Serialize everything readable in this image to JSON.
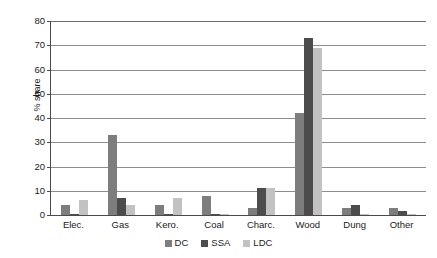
{
  "chart_data": {
    "type": "bar",
    "title": "",
    "xlabel": "",
    "ylabel": "% share",
    "ylim": [
      0,
      80
    ],
    "ytick_step": 10,
    "yticks": [
      0,
      10,
      20,
      30,
      40,
      50,
      60,
      70,
      80
    ],
    "ytick_labels": [
      "0",
      "10",
      "20",
      "30",
      "40",
      "50",
      "60",
      "70",
      "80"
    ],
    "grid": "horizontal",
    "legend_position": "bottom-center",
    "categories": [
      "Elec.",
      "Gas",
      "Kero.",
      "Coal",
      "Charc.",
      "Wood",
      "Dung",
      "Other"
    ],
    "series": [
      {
        "name": "DC",
        "color": "#7d7d7d",
        "values": [
          4,
          33,
          4,
          8,
          3,
          42,
          3,
          3
        ]
      },
      {
        "name": "SSA",
        "color": "#4c4c4c",
        "values": [
          0.5,
          7,
          0.5,
          0.5,
          11,
          73,
          4,
          1.5
        ]
      },
      {
        "name": "LDC",
        "color": "#c2c2c2",
        "values": [
          6,
          4,
          7,
          0.5,
          11,
          69,
          0.3,
          0.3
        ]
      }
    ]
  },
  "axes": {
    "y_title": "% share"
  },
  "legend": {
    "entries": [
      {
        "label": "DC",
        "swatch": "dc"
      },
      {
        "label": "SSA",
        "swatch": "ssa"
      },
      {
        "label": "LDC",
        "swatch": "ldc"
      }
    ]
  },
  "colors": {
    "dc": "#7d7d7d",
    "ssa": "#4c4c4c",
    "ldc": "#c2c2c2",
    "axis": "#4a4a4a",
    "gridline": "#8d8d8d",
    "background": "#ffffff",
    "text": "#1a1a1a"
  }
}
